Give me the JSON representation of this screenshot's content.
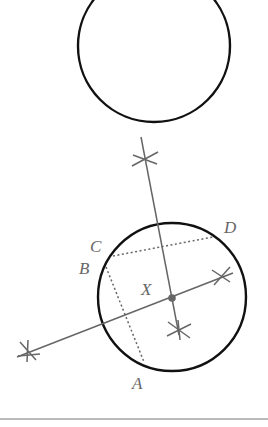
{
  "diagram": {
    "labels": {
      "A": "A",
      "B": "B",
      "C": "C",
      "D": "D",
      "X": "X"
    },
    "colors": {
      "circle": "#111111",
      "construction": "#666666",
      "label": "#666666",
      "rule": "#777777"
    },
    "top_circle": {
      "cx": 154,
      "cy": 46,
      "r": 76
    },
    "lower_circle": {
      "cx": 172,
      "cy": 297,
      "r": 74
    },
    "center_point": "X"
  }
}
